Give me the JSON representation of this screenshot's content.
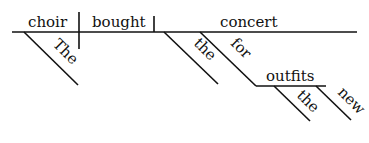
{
  "diagram": {
    "type": "sentence-diagram",
    "sentence": "The choir bought the concert outfits for the new concert",
    "baseline": {
      "subject": "choir",
      "verb": "bought",
      "object": "concert"
    },
    "modifiers": {
      "subject_article": "The",
      "object_article": "the",
      "preposition": "for",
      "prep_object": "outfits",
      "prep_object_article": "the",
      "prep_object_adjective": "new"
    },
    "colors": {
      "ink": "#111111",
      "background": "#ffffff"
    }
  }
}
